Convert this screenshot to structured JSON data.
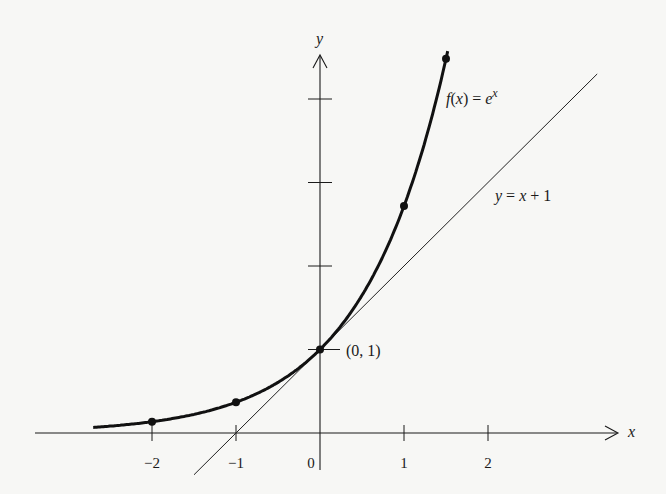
{
  "chart_data": {
    "type": "line",
    "title": "",
    "xlabel": "x",
    "ylabel": "y",
    "xlim": [
      -2.7,
      3.5
    ],
    "ylim": [
      -0.4,
      4.6
    ],
    "grid": false,
    "x_ticks": [
      -2,
      -1,
      0,
      1,
      2
    ],
    "x_tick_labels": [
      "−2",
      "−1",
      "0",
      "1",
      "2"
    ],
    "y_ticks": [
      1,
      2,
      3,
      4
    ],
    "series": [
      {
        "name": "f(x) = e^x",
        "label_main": "f(x) = e",
        "label_sup": "x",
        "style": "thick",
        "x_range": [
          -2.7,
          1.53
        ],
        "points": [
          {
            "x": -2,
            "y": 0.135
          },
          {
            "x": -1,
            "y": 0.368
          },
          {
            "x": 0,
            "y": 1
          },
          {
            "x": 1,
            "y": 2.718
          },
          {
            "x": 1.5,
            "y": 4.482
          }
        ]
      },
      {
        "name": "y = x + 1",
        "label": "y = x + 1",
        "style": "thin",
        "x_range": [
          -1.5,
          3.3
        ]
      }
    ],
    "annotations": [
      {
        "text": "(0, 1)",
        "x": 0,
        "y": 1
      }
    ]
  }
}
